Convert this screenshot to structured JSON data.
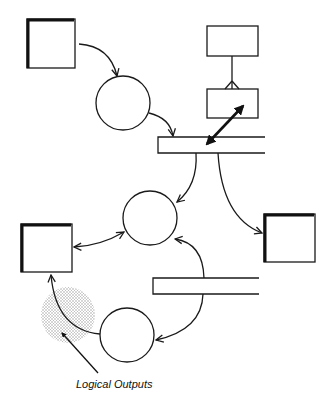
{
  "diagram": {
    "type": "data-flow-diagram",
    "annotation": {
      "label": "Logical Outputs",
      "color": "#111111"
    },
    "colors": {
      "line": "#1a1a1a",
      "shade": "#9a9a9a",
      "background": "#ffffff"
    },
    "nodes": [
      {
        "id": "external-entity-top-left",
        "kind": "external-entity"
      },
      {
        "id": "process-1",
        "kind": "process"
      },
      {
        "id": "entity-box-top",
        "kind": "entity"
      },
      {
        "id": "entity-box-middle",
        "kind": "entity"
      },
      {
        "id": "data-store-1",
        "kind": "data-store"
      },
      {
        "id": "process-2",
        "kind": "process"
      },
      {
        "id": "external-entity-right",
        "kind": "external-entity"
      },
      {
        "id": "external-entity-left",
        "kind": "external-entity"
      },
      {
        "id": "data-store-2",
        "kind": "data-store"
      },
      {
        "id": "process-3",
        "kind": "process"
      }
    ],
    "edges": [
      {
        "from": "external-entity-top-left",
        "to": "process-1"
      },
      {
        "from": "process-1",
        "to": "data-store-1"
      },
      {
        "from": "entity-box-top",
        "to": "entity-box-middle",
        "kind": "one-to-many"
      },
      {
        "from": "entity-box-middle",
        "to": "data-store-1",
        "kind": "bidirectional"
      },
      {
        "from": "data-store-1",
        "to": "process-2"
      },
      {
        "from": "data-store-1",
        "to": "external-entity-right"
      },
      {
        "from": "process-2",
        "to": "external-entity-left",
        "kind": "bidirectional"
      },
      {
        "from": "data-store-2",
        "to": "process-2"
      },
      {
        "from": "data-store-2",
        "to": "process-3"
      },
      {
        "from": "process-3",
        "to": "external-entity-left"
      }
    ]
  }
}
